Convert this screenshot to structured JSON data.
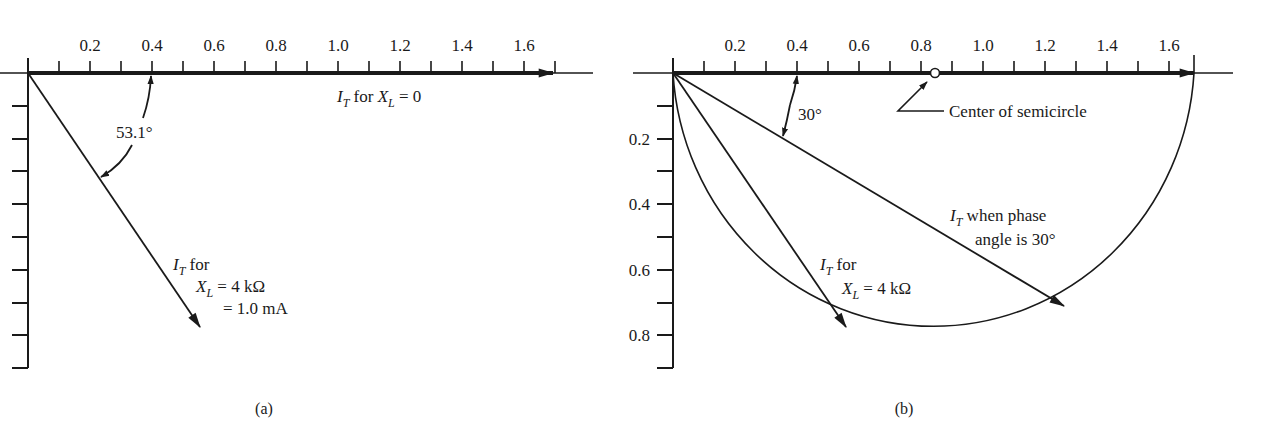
{
  "figure": {
    "panels": [
      {
        "id": "a",
        "caption": "(a)",
        "x_axis": {
          "tick_labels": [
            "0.2",
            "0.4",
            "0.6",
            "0.8",
            "1.0",
            "1.2",
            "1.4",
            "1.6"
          ],
          "minor_step": 0.1,
          "range": [
            0,
            1.7
          ]
        },
        "y_axis": {
          "tick_labels": [],
          "ticks_count": 9,
          "minor_step": 0.1,
          "range": [
            0,
            0.9
          ]
        },
        "annotations": {
          "horizontal_phasor": {
            "I": "I",
            "I_sub": "T",
            "mid": " for ",
            "X": "X",
            "X_sub": "L",
            "tail": " = 0"
          },
          "angle": "53.1°",
          "diagonal_phasor": {
            "line1_I": "I",
            "line1_sub": "T",
            "line1_tail": " for",
            "line2_X": "X",
            "line2_sub": "L",
            "line2_tail": " = 4 kΩ",
            "line3": "= 1.0 mA"
          }
        }
      },
      {
        "id": "b",
        "caption": "(b)",
        "x_axis": {
          "tick_labels": [
            "0.2",
            "0.4",
            "0.6",
            "0.8",
            "1.0",
            "1.2",
            "1.4",
            "1.6"
          ],
          "minor_step": 0.1,
          "range": [
            0,
            1.7
          ]
        },
        "y_axis": {
          "tick_labels": [
            "0.2",
            "0.4",
            "0.6",
            "0.8"
          ],
          "minor_step": 0.1,
          "range": [
            0,
            0.9
          ]
        },
        "annotations": {
          "angle": "30°",
          "center_label": "Center of semicircle",
          "phasor_30": {
            "I": "I",
            "I_sub": "T",
            "line1_tail": " when phase",
            "line2": "angle is 30°"
          },
          "phasor_4k": {
            "I": "I",
            "I_sub": "T",
            "line1_tail": " for",
            "X": "X",
            "X_sub": "L",
            "line2_tail": " = 4 kΩ"
          }
        }
      }
    ]
  }
}
